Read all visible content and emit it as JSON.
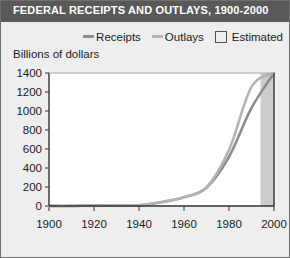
{
  "title": "FEDERAL RECEIPTS AND OUTLAYS, 1900-2000",
  "unit_label": "Billions of dollars",
  "legend": {
    "receipts_label": "Receipts",
    "outlays_label": "Outlays",
    "estimated_label": "Estimated"
  },
  "colors": {
    "title_bar": "#595959",
    "title_text": "#ffffff",
    "background": "#eeeeee",
    "plot_background": "#ffffff",
    "receipts_line": "#8c8c8c",
    "outlays_line": "#b4b4b4",
    "estimated_band": "#cccccc",
    "axis": "#333333",
    "text": "#1a1a1a"
  },
  "chart_data": {
    "type": "line",
    "title": "FEDERAL RECEIPTS AND OUTLAYS, 1900-2000",
    "xlabel": "",
    "ylabel": "Billions of dollars",
    "xlim": [
      1900,
      2000
    ],
    "ylim": [
      0,
      1400
    ],
    "xticks": [
      1900,
      1920,
      1940,
      1960,
      1980,
      2000
    ],
    "yticks": [
      0,
      200,
      400,
      600,
      800,
      1000,
      1200,
      1400
    ],
    "xticklabels": [
      "1900",
      "1920",
      "1940",
      "1960",
      "1980",
      "2000"
    ],
    "yticklabels": [
      "0",
      "200",
      "400",
      "600",
      "800",
      "1000",
      "1200",
      "1400"
    ],
    "grid": false,
    "legend_position": "top",
    "x": [
      1900,
      1910,
      1920,
      1930,
      1940,
      1950,
      1960,
      1970,
      1980,
      1990,
      2000
    ],
    "series": [
      {
        "name": "Receipts",
        "color": "#8c8c8c",
        "values": [
          1,
          1,
          7,
          4,
          7,
          39,
          92,
          193,
          517,
          1032,
          1400
        ]
      },
      {
        "name": "Outlays",
        "color": "#b4b4b4",
        "values": [
          1,
          1,
          6,
          3,
          9,
          43,
          92,
          196,
          591,
          1253,
          1790
        ]
      }
    ],
    "annotations": [
      {
        "type": "band",
        "label": "Estimated",
        "axis": "x",
        "from": 1994,
        "to": 2000,
        "color": "#cccccc"
      }
    ]
  }
}
